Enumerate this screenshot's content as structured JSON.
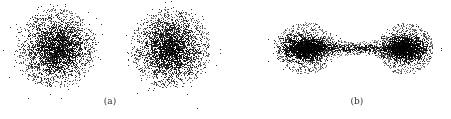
{
  "figure": {
    "background": "#ffffff",
    "dot_color": "#000000",
    "panels": [
      {
        "id": "a",
        "label": "(a)",
        "label_pos": [
          110,
          102
        ],
        "description": "Two separate isotropic point clouds",
        "box": [
          10,
          5,
          205,
          88
        ],
        "clouds": [
          {
            "type": "gaussian",
            "cx": 56,
            "cy": 48,
            "sigma": 14,
            "halo_radius": 40,
            "core_points": 2600,
            "halo_points": 900
          },
          {
            "type": "gaussian",
            "cx": 170,
            "cy": 48,
            "sigma": 14,
            "halo_radius": 40,
            "core_points": 2600,
            "halo_points": 900
          }
        ]
      },
      {
        "id": "b",
        "label": "(b)",
        "label_pos": [
          357,
          102
        ],
        "description": "Two point clouds joined by a thin bridge",
        "box": [
          270,
          12,
          165,
          72
        ],
        "clouds": [
          {
            "type": "elongated",
            "cx": 305,
            "cy": 48,
            "sx": 11,
            "sy": 6,
            "halo_rx": 30,
            "halo_ry": 26,
            "core_points": 1900,
            "halo_points": 800
          },
          {
            "type": "elongated",
            "cx": 405,
            "cy": 48,
            "sx": 10,
            "sy": 6,
            "halo_rx": 28,
            "halo_ry": 26,
            "core_points": 1800,
            "halo_points": 800
          },
          {
            "type": "bridge",
            "x0": 305,
            "x1": 405,
            "cy": 48,
            "thickness": 2.2,
            "points": 700,
            "halo_points": 500,
            "halo_height": 14
          }
        ]
      }
    ]
  }
}
